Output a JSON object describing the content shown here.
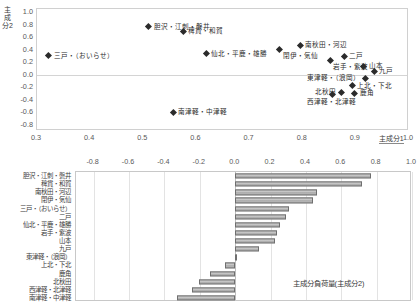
{
  "chart_data": [
    {
      "type": "scatter",
      "title": "",
      "xlabel": "主成分1",
      "ylabel": "主成分2",
      "xlim": [
        0.3,
        1.0
      ],
      "ylim": [
        -0.9,
        1.05
      ],
      "xticks": [
        "0.3",
        "0.4",
        "0.5",
        "0.6",
        "0.7",
        "0.8",
        "0.9",
        "1.0"
      ],
      "xtick_values": [
        0.3,
        0.4,
        0.5,
        0.6,
        0.7,
        0.8,
        0.9,
        1.0
      ],
      "yticks": [
        "1.0",
        "0.8",
        "0.6",
        "0.4",
        "0.2",
        "0.0",
        "-0.2",
        "-0.4",
        "-0.6",
        "-0.8"
      ],
      "ytick_values": [
        1.0,
        0.8,
        0.6,
        0.4,
        0.2,
        0.0,
        -0.2,
        -0.4,
        -0.6,
        -0.8
      ],
      "grid": false,
      "legend": "none",
      "points": [
        {
          "label": "胆沢・江刺・磐井",
          "x": 0.51,
          "y": 0.765,
          "pos": "lbl-r"
        },
        {
          "label": "稗貫・和賀",
          "x": 0.575,
          "y": 0.695,
          "pos": "lbl-r"
        },
        {
          "label": "三戸・（おいらせ）",
          "x": 0.322,
          "y": 0.305,
          "pos": "lbl-r"
        },
        {
          "label": "南秋田・河辺",
          "x": 0.795,
          "y": 0.475,
          "pos": "lbl-r"
        },
        {
          "label": "閉伊・気仙",
          "x": 0.757,
          "y": 0.405,
          "pos": "lbl-br"
        },
        {
          "label": "仙北・平鹿・雄勝",
          "x": 0.618,
          "y": 0.335,
          "pos": "lbl-r"
        },
        {
          "label": "二戸",
          "x": 0.878,
          "y": 0.295,
          "pos": "lbl-r"
        },
        {
          "label": "岩手・紫波",
          "x": 0.852,
          "y": 0.235,
          "pos": "lbl-br"
        },
        {
          "label": "山本",
          "x": 0.915,
          "y": 0.135,
          "pos": "lbl-r"
        },
        {
          "label": "九戸",
          "x": 0.935,
          "y": 0.055,
          "pos": "lbl-r"
        },
        {
          "label": "東津軽・（浪岡）",
          "x": 0.918,
          "y": -0.055,
          "pos": "lbl-l"
        },
        {
          "label": "上北・下北",
          "x": 0.893,
          "y": -0.175,
          "pos": "lbl-r"
        },
        {
          "label": "北秋田",
          "x": 0.872,
          "y": -0.275,
          "pos": "lbl-l"
        },
        {
          "label": "鹿角",
          "x": 0.898,
          "y": -0.295,
          "pos": "lbl-r"
        },
        {
          "label": "西津軽・北津軽",
          "x": 0.855,
          "y": -0.315,
          "pos": "lbl-b"
        },
        {
          "label": "南津軽・中津軽",
          "x": 0.556,
          "y": -0.595,
          "pos": "lbl-r"
        }
      ]
    },
    {
      "type": "bar",
      "title": "",
      "orientation": "horizontal",
      "xlabel": "主成分負荷量(主成分2)",
      "ylabel": "",
      "xlim": [
        -0.9,
        1.0
      ],
      "xticks": [
        "-0.8",
        "-0.6",
        "-0.4",
        "-0.2",
        "0.0",
        "0.2",
        "0.4",
        "0.6",
        "0.8",
        "1.0"
      ],
      "xtick_values": [
        -0.8,
        -0.6,
        -0.4,
        -0.2,
        0.0,
        0.2,
        0.4,
        0.6,
        0.8,
        1.0
      ],
      "grid": true,
      "legend": "none",
      "categories": [
        "胆沢・江刺・磐井",
        "稗貫・和賀",
        "南秋田・河辺",
        "閉伊・気仙",
        "三戸・（おいらせ）",
        "二戸",
        "仙北・平鹿・雄勝",
        "岩手・紫波",
        "山本",
        "九戸",
        "東津軽・（浪岡）",
        "上北・下北",
        "鹿角",
        "北秋田",
        "西津軽・北津軽",
        "南津軽・中津軽"
      ],
      "values": [
        0.77,
        0.72,
        0.46,
        0.44,
        0.305,
        0.29,
        0.255,
        0.235,
        0.225,
        0.135,
        0.005,
        -0.055,
        -0.145,
        -0.205,
        -0.245,
        -0.33
      ]
    }
  ]
}
